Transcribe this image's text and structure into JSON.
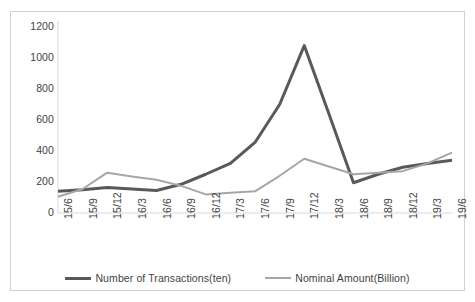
{
  "chart_data": {
    "type": "line",
    "title": "",
    "xlabel": "",
    "ylabel": "",
    "grid": false,
    "legend_position": "bottom",
    "ylim": [
      0,
      1200
    ],
    "yticks": [
      0,
      200,
      400,
      600,
      800,
      1000,
      1200
    ],
    "ytick_labels": [
      "0",
      "200",
      "400",
      "600",
      "800",
      "1000",
      "1200"
    ],
    "categories": [
      "15/6",
      "15/9",
      "15/12",
      "16/3",
      "16/6",
      "16/9",
      "16/12",
      "17/3",
      "17/6",
      "17/9",
      "17/12",
      "18/3",
      "18/6",
      "18/9",
      "18/12",
      "19/3",
      "19/6"
    ],
    "series": [
      {
        "name": "Number of Transactions(ten)",
        "color": "#595959",
        "width": 3,
        "values": [
          140,
          150,
          165,
          155,
          145,
          185,
          250,
          320,
          455,
          700,
          1080,
          640,
          195,
          250,
          295,
          320,
          340
        ]
      },
      {
        "name": "Nominal Amount(Billion)",
        "color": "#a6a6a6",
        "width": 2,
        "values": [
          105,
          155,
          260,
          235,
          215,
          175,
          120,
          130,
          140,
          240,
          350,
          300,
          250,
          260,
          270,
          320,
          390
        ]
      }
    ]
  },
  "axis": {
    "axis_line_color": "#d9d9d9",
    "frame_border_color": "#d0d0d0",
    "tick_text_color": "#3f3f3f"
  }
}
